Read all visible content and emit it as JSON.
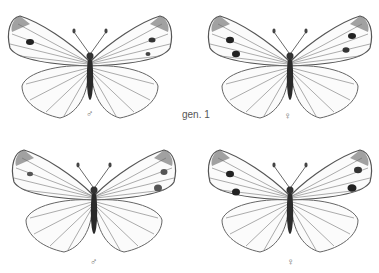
{
  "plate": {
    "generation_label": "gen. 1",
    "specimens": [
      {
        "id": "top-left",
        "sex_symbol": "♂",
        "row": 1
      },
      {
        "id": "top-right",
        "sex_symbol": "♀",
        "row": 1
      },
      {
        "id": "bottom-left",
        "sex_symbol": "♂",
        "row": 2
      },
      {
        "id": "bottom-right",
        "sex_symbol": "♀",
        "row": 2
      }
    ]
  },
  "colors": {
    "background": "#ffffff",
    "ink": "#333333",
    "vein": "#555555",
    "spot": "#222222"
  }
}
